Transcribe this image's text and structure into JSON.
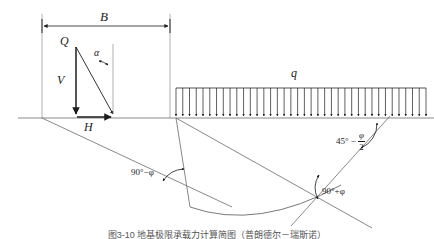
{
  "figure": {
    "domain_type": "engineering-diagram",
    "background_color": "#ffffff",
    "line_color": "#4a4a4a",
    "text_color": "#1c1c1c",
    "caption": "图3-10 地基极限承载力计算简图（普朗德尔－瑞斯诺）"
  },
  "labels": {
    "width_dimension": "B",
    "resultant_load": "Q",
    "vertical_component": "V",
    "horizontal_component": "H",
    "load_inclination": "α",
    "surcharge": "q",
    "angle_radial_left": "90°−φ",
    "angle_passive_right_prefix": "45° −",
    "angle_passive_numerator": "φ",
    "angle_passive_denominator": "2",
    "angle_radial_right": "90°+φ"
  },
  "geometry": {
    "ground_line_y": 118,
    "ground_line_x_start": 18,
    "ground_line_x_end": 434,
    "footing_left_x": 42,
    "footing_right_x": 170,
    "dimension_line_y": 26,
    "surcharge_top_y": 88,
    "surcharge_arrow_tip_y": 116,
    "surcharge_x_start": 176,
    "surcharge_x_end": 426,
    "surcharge_arrow_count": 38,
    "wedge_apex_x": 176,
    "wedge_apex_y": 118,
    "spiral_low_x": 232,
    "spiral_low_y": 207
  }
}
